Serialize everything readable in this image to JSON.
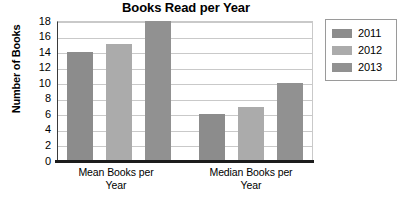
{
  "chart_data": {
    "type": "bar",
    "title": "Books Read per Year",
    "xlabel": "",
    "ylabel": "Number of Books",
    "categories": [
      "Mean Books per Year",
      "Median Books per Year"
    ],
    "series": [
      {
        "name": "2011",
        "values": [
          14,
          6
        ],
        "color": "#8c8c8c"
      },
      {
        "name": "2012",
        "values": [
          15,
          7
        ],
        "color": "#ababab"
      },
      {
        "name": "2013",
        "values": [
          18,
          10
        ],
        "color": "#919191"
      }
    ],
    "ylim": [
      0,
      18
    ],
    "ytick_step": 2,
    "yticks": [
      18,
      16,
      14,
      12,
      10,
      8,
      6,
      4,
      2,
      0
    ],
    "grid": true,
    "legend_position": "right"
  },
  "legend": {
    "items": [
      {
        "label": "2011",
        "color": "#8c8c8c"
      },
      {
        "label": "2012",
        "color": "#ababab"
      },
      {
        "label": "2013",
        "color": "#919191"
      }
    ]
  },
  "axes": {
    "y_title": "Number of Books",
    "y_ticks": [
      "18",
      "16",
      "14",
      "12",
      "10",
      "8",
      "6",
      "4",
      "2",
      "0"
    ],
    "x_categories": [
      {
        "line1": "Mean Books per",
        "line2": "Year"
      },
      {
        "line1": "Median Books per",
        "line2": "Year"
      }
    ]
  },
  "title": "Books Read per Year",
  "colors": {
    "axis": "#1c1c1c",
    "grid": "#c9c9c9",
    "background": "#ffffff",
    "legend_border": "#9a9a9a"
  }
}
